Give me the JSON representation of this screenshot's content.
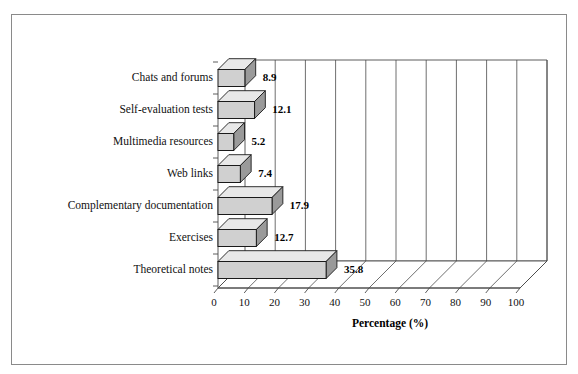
{
  "figure": {
    "border_color": "#8a8a8a",
    "background": "#ffffff"
  },
  "chart_data": {
    "type": "bar",
    "orientation": "horizontal",
    "style": "3d",
    "title": "",
    "xlabel": "Percentage (%)",
    "ylabel": "",
    "xlim": [
      0,
      100
    ],
    "xticks": [
      0,
      10,
      20,
      30,
      40,
      50,
      60,
      70,
      80,
      90,
      100
    ],
    "xtick_labels": [
      "0",
      "10",
      "20",
      "30",
      "40",
      "50",
      "60",
      "70",
      "80",
      "90",
      "100"
    ],
    "grid": "vertical",
    "legend": "none",
    "categories": [
      "Chats and forums",
      "Self-evaluation tests",
      "Multimedia resources",
      "Web links",
      "Complementary documentation",
      "Exercises",
      "Theoretical notes"
    ],
    "values": [
      8.9,
      12.1,
      5.2,
      7.4,
      17.9,
      12.7,
      35.8
    ],
    "value_labels": [
      "8.9",
      "12.1",
      "5.2",
      "7.4",
      "17.9",
      "12.7",
      "35.8"
    ],
    "bar_face_color": "#d0d0d0",
    "bar_top_color": "#e8e8e8",
    "bar_side_color": "#9a9a9a",
    "bar_edge_color": "#1a1a1a"
  }
}
